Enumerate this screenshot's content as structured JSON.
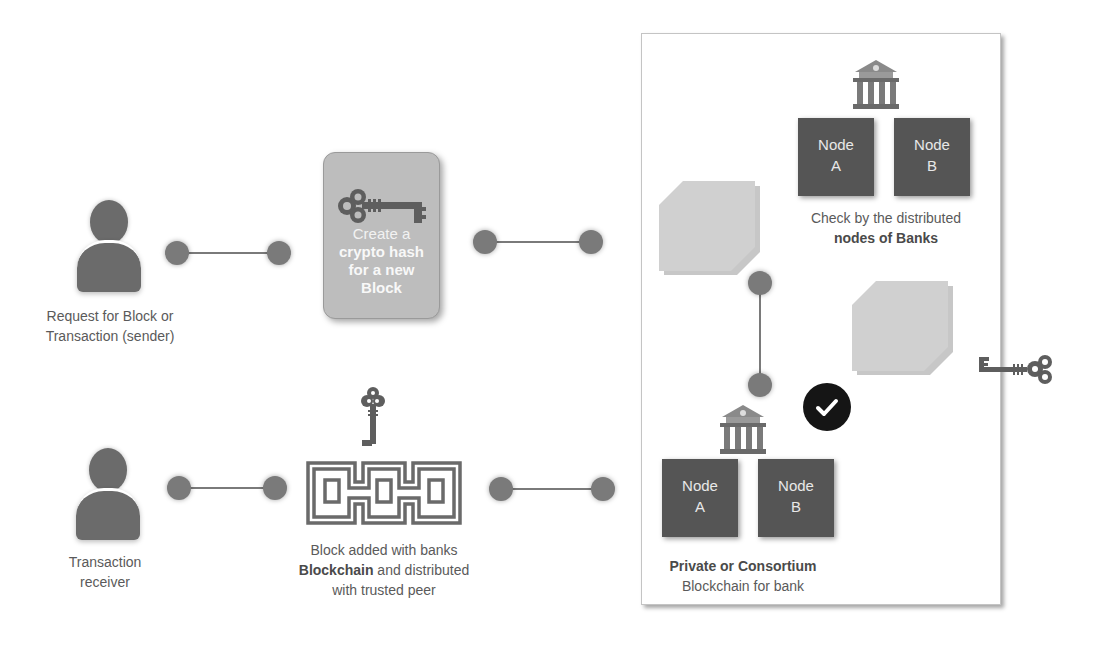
{
  "diagram": {
    "sender": {
      "icon": "person-icon",
      "label_line1": "Request for Block or",
      "label_line2": "Transaction (sender)"
    },
    "hash_card": {
      "icon": "key-icon",
      "line1": "Create a",
      "line2": "crypto hash",
      "line3": "for a new",
      "line4": "Block"
    },
    "receiver": {
      "icon": "person-icon",
      "label_line1": "Transaction",
      "label_line2": "receiver"
    },
    "blockchain": {
      "icon": "chain-icon",
      "key_icon": "key-icon",
      "line1": "Block added with banks",
      "line2_bold": "Blockchain",
      "line2_rest": " and distributed",
      "line3": "with trusted peer"
    },
    "panel": {
      "top_bank": {
        "icon": "bank-icon",
        "node_a_line1": "Node",
        "node_a_line2": "A",
        "node_b_line1": "Node",
        "node_b_line2": "B",
        "caption_line1": "Check by the distributed",
        "caption_line2_bold": "nodes of Banks"
      },
      "bottom_bank": {
        "icon": "bank-icon",
        "node_a_line1": "Node",
        "node_a_line2": "A",
        "node_b_line1": "Node",
        "node_b_line2": "B",
        "caption_line1_bold": "Private or Consortium",
        "caption_line2": "Blockchain for bank"
      },
      "check_icon": "checkmark-icon",
      "side_key_icon": "key-icon"
    },
    "colors": {
      "connector": "#7a7a7a",
      "node_fill": "#555555",
      "block_fill": "#d0d0d0",
      "card_fill": "#bdbdbd",
      "check_fill": "#151515",
      "text": "#5a5a5a"
    }
  }
}
